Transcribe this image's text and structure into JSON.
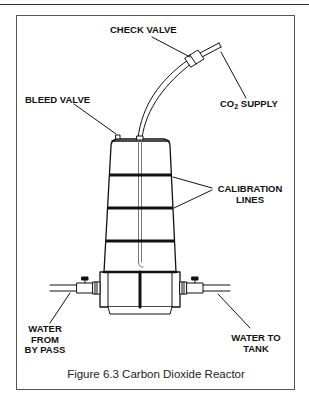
{
  "header": {
    "corner_text": "Reactor"
  },
  "diagram": {
    "labels": {
      "check_valve": "CHECK VALVE",
      "co2_supply_prefix": "CO",
      "co2_supply_sub": "2",
      "co2_supply_suffix": " SUPPLY",
      "bleed_valve": "BLEED VALVE",
      "calibration_line1": "CALIBRATION",
      "calibration_line2": "LINES",
      "water_from_line1": "WATER",
      "water_from_line2": "FROM",
      "water_from_line3": "BY PASS",
      "water_to_line1": "WATER TO",
      "water_to_line2": "TANK"
    },
    "caption": "Figure 6.3 Carbon Dioxide Reactor",
    "colors": {
      "line": "#111111",
      "frame": "#555555",
      "fill": "#ffffff"
    }
  }
}
